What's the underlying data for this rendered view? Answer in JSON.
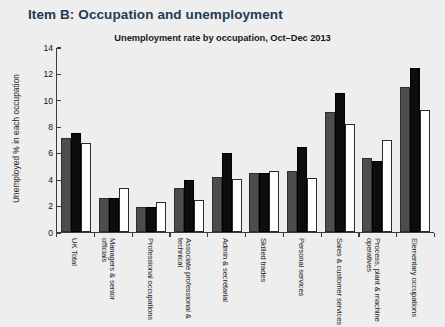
{
  "page": {
    "item_heading": "Item B: Occupation and unemployment"
  },
  "chart_data": {
    "type": "bar",
    "title": "Unemployment rate by occupation, Oct–Dec 2013",
    "xlabel": "",
    "ylabel": "Unemployed % in each occupation",
    "ylim": [
      0,
      14
    ],
    "yticks": [
      0,
      2,
      4,
      6,
      8,
      10,
      12,
      14
    ],
    "ytick_labels": [
      "0",
      "2",
      "4",
      "6",
      "8",
      "10",
      "12",
      "14"
    ],
    "grid": false,
    "legend": "none",
    "categories": [
      "UK Total",
      "Managers & senior officials",
      "Professional occupations",
      "Associate professional & technical",
      "Admin & secretarial",
      "Skilled trades",
      "Personal services",
      "Sales & customer services",
      "Process, plant & machine operatives",
      "Elementary occupations"
    ],
    "series": [
      {
        "name": "series-1",
        "color": "#4d4d4d",
        "values": [
          7.1,
          2.6,
          1.9,
          3.3,
          4.2,
          4.5,
          4.6,
          9.1,
          5.6,
          11.0
        ]
      },
      {
        "name": "series-2",
        "color": "#0d0d0d",
        "values": [
          7.5,
          2.6,
          1.9,
          3.9,
          6.0,
          4.5,
          6.4,
          10.5,
          5.4,
          12.4
        ]
      },
      {
        "name": "series-3",
        "color": "#ffffff",
        "values": [
          6.7,
          3.3,
          2.3,
          2.4,
          4.0,
          4.6,
          4.1,
          8.2,
          7.0,
          9.2
        ]
      }
    ]
  }
}
